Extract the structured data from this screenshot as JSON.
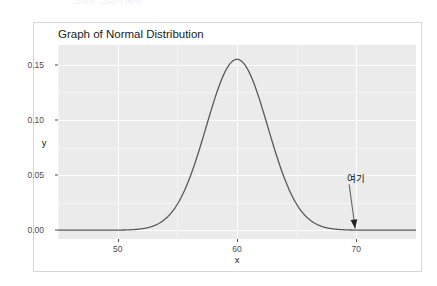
{
  "page": {
    "background_color": "#ffffff",
    "cut_off_top_text": "그래프 그리기 예제"
  },
  "card": {
    "background_color": "#ffffff",
    "border_color": "#d6d6d6"
  },
  "chart_data": {
    "type": "line",
    "title": "Graph of Normal Distribution",
    "xlabel": "x",
    "ylabel": "y",
    "grid": true,
    "legend": "none",
    "panel_background": "#ebebeb",
    "gridline_color": "#ffffff",
    "line_color": "#595959",
    "line_width": 1.3,
    "distribution": {
      "name": "normal",
      "mean": 60,
      "sd": 2.575,
      "peak_density": 0.155
    },
    "xlim": [
      45,
      75
    ],
    "ylim": [
      -0.008,
      0.168
    ],
    "xticks": [
      50,
      60,
      70
    ],
    "xtick_labels": [
      "50",
      "60",
      "70"
    ],
    "xticks_minor": [
      45,
      55,
      65,
      75
    ],
    "yticks": [
      0.0,
      0.05,
      0.1,
      0.15
    ],
    "ytick_labels": [
      "0.00",
      "0.05",
      "0.10",
      "0.15"
    ],
    "yticks_minor": [
      0.025,
      0.075,
      0.125
    ],
    "x": [
      45,
      46,
      47,
      48,
      49,
      50,
      51,
      52,
      53,
      54,
      55,
      56,
      57,
      58,
      59,
      60,
      61,
      62,
      63,
      64,
      65,
      66,
      67,
      68,
      69,
      70,
      71,
      72,
      73,
      74,
      75
    ],
    "y": [
      0.0,
      0.0,
      0.0,
      0.0,
      0.0,
      2e-05,
      0.00013,
      0.00062,
      0.00244,
      0.00772,
      0.01968,
      0.04041,
      0.06684,
      0.08911,
      0.09578,
      0.15494,
      0.14394,
      0.11553,
      0.08076,
      0.04907,
      0.02593,
      0.01192,
      0.00476,
      0.00165,
      0.0005,
      0.00013,
      3e-05,
      0.0,
      0.0,
      0.0,
      0.0
    ],
    "annotations": [
      {
        "text": "여기",
        "text_x": 69.4,
        "text_y": 0.0415,
        "arrow_tip_x": 69.9,
        "arrow_tip_y": 0.0015,
        "arrow_color": "#666666"
      }
    ]
  }
}
